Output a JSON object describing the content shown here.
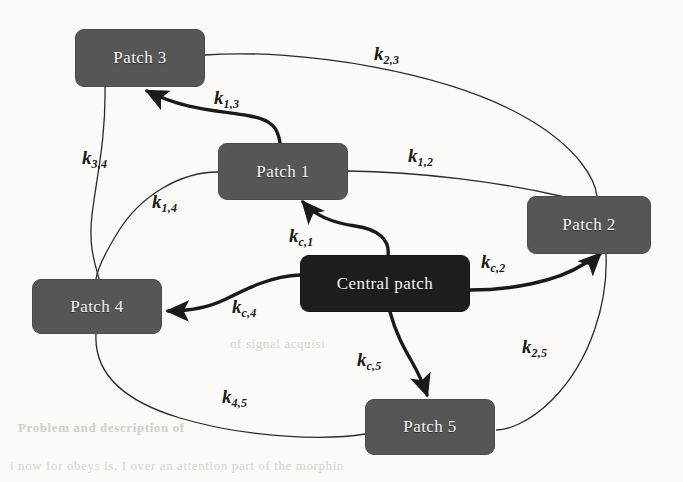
{
  "figure": {
    "type": "compartment-network-diagram",
    "background_color": "#fbfaf8",
    "node_color": "#565656",
    "central_node_color": "#1d1d1d",
    "edge_color": "#1a1a1a"
  },
  "nodes": [
    {
      "id": "patch3",
      "label": "Patch 3",
      "x": 75,
      "y": 29,
      "w": 130,
      "h": 58,
      "style": "patch"
    },
    {
      "id": "patch1",
      "label": "Patch 1",
      "x": 218,
      "y": 143,
      "w": 130,
      "h": 57,
      "style": "patch"
    },
    {
      "id": "patch2",
      "label": "Patch 2",
      "x": 527,
      "y": 196,
      "w": 124,
      "h": 58,
      "style": "patch"
    },
    {
      "id": "patch4",
      "label": "Patch 4",
      "x": 32,
      "y": 279,
      "w": 130,
      "h": 55,
      "style": "patch"
    },
    {
      "id": "central",
      "label": "Central patch",
      "x": 300,
      "y": 255,
      "w": 170,
      "h": 57,
      "style": "central"
    },
    {
      "id": "patch5",
      "label": "Patch 5",
      "x": 365,
      "y": 399,
      "w": 130,
      "h": 56,
      "style": "patch"
    }
  ],
  "edges": [
    {
      "id": "k23",
      "base": "k",
      "sub": "2,3",
      "from": "patch3",
      "to": "patch2",
      "arrow": false,
      "weight": "thin",
      "label_x": 374,
      "label_y": 44
    },
    {
      "id": "k13",
      "base": "k",
      "sub": "1,3",
      "from": "patch1",
      "to": "patch3",
      "arrow": true,
      "weight": "thick",
      "label_x": 214,
      "label_y": 88
    },
    {
      "id": "k34",
      "base": "k",
      "sub": "3,4",
      "from": "patch3",
      "to": "patch4",
      "arrow": false,
      "weight": "thin",
      "label_x": 82,
      "label_y": 148
    },
    {
      "id": "k12",
      "base": "k",
      "sub": "1,2",
      "from": "patch1",
      "to": "patch2",
      "arrow": false,
      "weight": "thin",
      "label_x": 408,
      "label_y": 146
    },
    {
      "id": "k14",
      "base": "k",
      "sub": "1,4",
      "from": "patch1",
      "to": "patch4",
      "arrow": false,
      "weight": "thin",
      "label_x": 152,
      "label_y": 192
    },
    {
      "id": "kc1",
      "base": "k",
      "sub": "c,1",
      "from": "central",
      "to": "patch1",
      "arrow": true,
      "weight": "thick",
      "label_x": 289,
      "label_y": 226
    },
    {
      "id": "kc2",
      "base": "k",
      "sub": "c,2",
      "from": "central",
      "to": "patch2",
      "arrow": true,
      "weight": "thick",
      "label_x": 481,
      "label_y": 252
    },
    {
      "id": "kc4",
      "base": "k",
      "sub": "c,4",
      "from": "central",
      "to": "patch4",
      "arrow": true,
      "weight": "thick",
      "label_x": 232,
      "label_y": 297
    },
    {
      "id": "k25",
      "base": "k",
      "sub": "2,5",
      "from": "patch2",
      "to": "patch5",
      "arrow": false,
      "weight": "thin",
      "label_x": 522,
      "label_y": 337
    },
    {
      "id": "kc5",
      "base": "k",
      "sub": "c,5",
      "from": "central",
      "to": "patch5",
      "arrow": true,
      "weight": "thick",
      "label_x": 357,
      "label_y": 350
    },
    {
      "id": "k45",
      "base": "k",
      "sub": "4,5",
      "from": "patch4",
      "to": "patch5",
      "arrow": false,
      "weight": "thin",
      "label_x": 222,
      "label_y": 387
    }
  ],
  "background_text": [
    {
      "text": "of signal acquisi",
      "x": 230,
      "y": 336,
      "bold": false
    },
    {
      "text": "Problem and description of",
      "x": 18,
      "y": 420,
      "bold": true
    },
    {
      "text": "i now for  obeys is. I over an attention  part  of  the  morphin",
      "x": 10,
      "y": 458,
      "bold": false
    }
  ]
}
